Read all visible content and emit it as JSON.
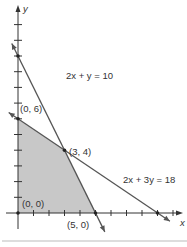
{
  "chart_data": {
    "type": "line",
    "title": "",
    "xlabel": "x",
    "ylabel": "y",
    "xlim": [
      0,
      10
    ],
    "ylim": [
      -1,
      13
    ],
    "x_ticks": [
      1,
      2,
      3,
      4,
      5,
      6,
      7,
      8,
      9,
      10
    ],
    "y_ticks": [
      1,
      2,
      3,
      4,
      5,
      6,
      7,
      8,
      9,
      10,
      11,
      12
    ],
    "lines": [
      {
        "name": "2x + y = 10",
        "a": 2,
        "b": 1,
        "c": 10,
        "label": "2x + y = 10"
      },
      {
        "name": "2x + 3y = 18",
        "a": 2,
        "b": 3,
        "c": 18,
        "label": "2x + 3y = 18"
      }
    ],
    "feasible_region": [
      [
        0,
        0
      ],
      [
        0,
        6
      ],
      [
        3,
        4
      ],
      [
        5,
        0
      ]
    ],
    "points": [
      {
        "x": 0,
        "y": 6,
        "label": "(0, 6)"
      },
      {
        "x": 3,
        "y": 4,
        "label": "(3, 4)"
      },
      {
        "x": 0,
        "y": 0,
        "label": "(0, 0)"
      },
      {
        "x": 5,
        "y": 0,
        "label": "(5, 0)"
      }
    ],
    "colors": {
      "region": "#c8c8c8",
      "line": "#555555",
      "axis": "#333333"
    }
  }
}
